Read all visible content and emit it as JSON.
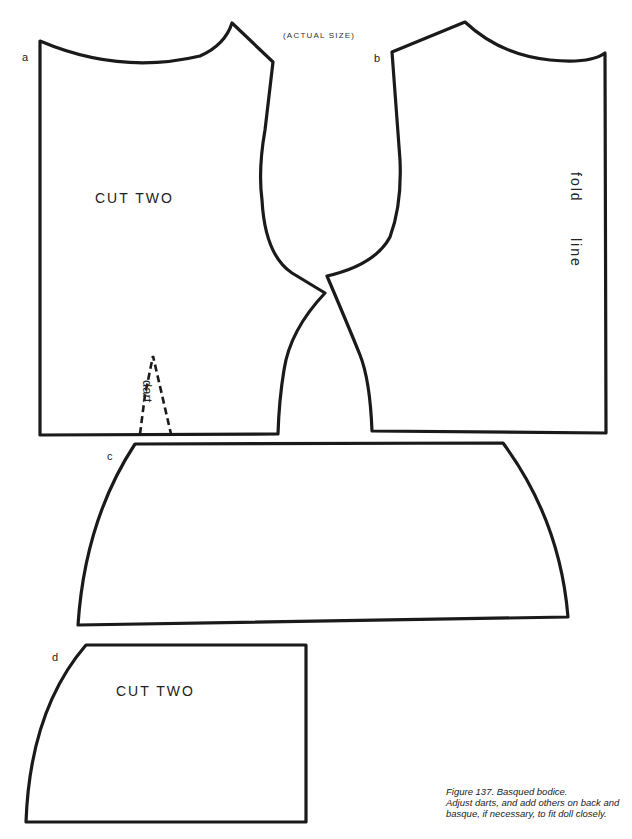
{
  "header": {
    "title": "(ACTUAL SIZE)"
  },
  "pieces": {
    "a": {
      "label": "a",
      "instruction": "CUT TWO",
      "dart_label": "dart"
    },
    "b": {
      "label": "b",
      "fold_1": "fold",
      "fold_2": "line"
    },
    "c": {
      "label": "c"
    },
    "d": {
      "label": "d",
      "instruction": "CUT TWO"
    }
  },
  "caption": {
    "title": "Figure 137. Basqued bodice.",
    "line1": "Adjust darts, and add others on back and",
    "line2": "basque, if necessary, to fit doll closely."
  },
  "colors": {
    "outline": "#1a1a1a",
    "background": "#ffffff"
  }
}
